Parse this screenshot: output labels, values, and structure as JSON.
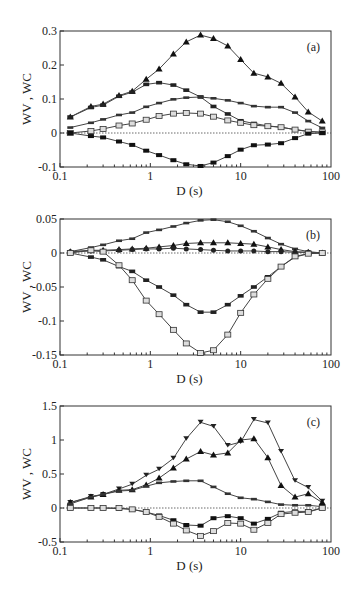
{
  "figure": {
    "panels": [
      "a",
      "b",
      "c"
    ]
  },
  "chart_data": [
    {
      "type": "line",
      "panel_label": "(a)",
      "xlabel": "D (s)",
      "ylabel": "WV , WC",
      "xscale": "log",
      "xlim": [
        0.1,
        100
      ],
      "ylim": [
        -0.1,
        0.3
      ],
      "xticks": [
        "0.1",
        "1",
        "10",
        "100"
      ],
      "yticks": [
        "-0.1",
        "0",
        "0.1",
        "0.2",
        "0.3"
      ],
      "grid": false,
      "zero_line": "dotted",
      "x": [
        0.13,
        0.22,
        0.3,
        0.45,
        0.63,
        0.9,
        1.25,
        1.8,
        2.5,
        3.6,
        5,
        7.2,
        10,
        14,
        20,
        28,
        40,
        56,
        80
      ],
      "series": [
        {
          "name": "filled-triangle",
          "marker": "triangle-filled",
          "values": [
            0.047,
            0.078,
            0.085,
            0.11,
            0.123,
            0.158,
            0.188,
            0.232,
            0.268,
            0.288,
            0.278,
            0.256,
            0.216,
            0.176,
            0.165,
            0.146,
            0.106,
            0.062,
            0.035
          ]
        },
        {
          "name": "filled-dash",
          "marker": "dash-filled",
          "values": [
            0.047,
            0.075,
            0.082,
            0.108,
            0.12,
            0.143,
            0.148,
            0.141,
            0.126,
            0.106,
            0.078,
            0.056,
            0.036,
            0.028,
            0.021,
            0.017,
            0.01,
            0.005,
            0.002
          ]
        },
        {
          "name": "half-dash",
          "marker": "bar",
          "values": [
            0.016,
            0.03,
            0.04,
            0.053,
            0.06,
            0.077,
            0.088,
            0.099,
            0.104,
            0.106,
            0.102,
            0.096,
            0.088,
            0.079,
            0.076,
            0.076,
            0.06,
            0.035,
            0.015
          ]
        },
        {
          "name": "open-square",
          "marker": "square-open",
          "values": [
            0.0,
            0.006,
            0.012,
            0.022,
            0.028,
            0.039,
            0.05,
            0.057,
            0.059,
            0.057,
            0.048,
            0.037,
            0.03,
            0.023,
            0.02,
            0.017,
            0.01,
            0.004,
            0.002
          ]
        },
        {
          "name": "filled-square",
          "marker": "square-filled",
          "values": [
            0.0,
            -0.009,
            -0.013,
            -0.025,
            -0.035,
            -0.052,
            -0.065,
            -0.08,
            -0.092,
            -0.097,
            -0.087,
            -0.068,
            -0.049,
            -0.036,
            -0.034,
            -0.03,
            -0.015,
            -0.002,
            0.0
          ]
        }
      ]
    },
    {
      "type": "line",
      "panel_label": "(b)",
      "xlabel": "D (s)",
      "ylabel": "WV , WC",
      "xscale": "log",
      "xlim": [
        0.1,
        100
      ],
      "ylim": [
        -0.15,
        0.05
      ],
      "xticks": [
        "0.1",
        "1",
        "10",
        "100"
      ],
      "yticks": [
        "-0.15",
        "-0.1",
        "-0.05",
        "0",
        "0.05"
      ],
      "grid": false,
      "zero_line": "dotted",
      "x": [
        0.13,
        0.22,
        0.3,
        0.45,
        0.63,
        0.9,
        1.25,
        1.8,
        2.5,
        3.6,
        5,
        7.2,
        10,
        14,
        20,
        28,
        40,
        56,
        80
      ],
      "series": [
        {
          "name": "half-dash",
          "marker": "bar",
          "values": [
            0.002,
            0.008,
            0.012,
            0.018,
            0.021,
            0.03,
            0.034,
            0.039,
            0.044,
            0.048,
            0.049,
            0.046,
            0.04,
            0.032,
            0.022,
            0.013,
            0.006,
            0.002,
            0.0
          ]
        },
        {
          "name": "filled-triangle",
          "marker": "triangle-filled",
          "values": [
            0.002,
            0.004,
            0.004,
            0.005,
            0.006,
            0.007,
            0.009,
            0.011,
            0.014,
            0.015,
            0.015,
            0.015,
            0.014,
            0.013,
            0.009,
            0.005,
            0.002,
            0.001,
            0.0
          ]
        },
        {
          "name": "filled-circle",
          "marker": "circle-filled",
          "values": [
            0.002,
            0.003,
            0.003,
            0.004,
            0.005,
            0.006,
            0.006,
            0.007,
            0.006,
            0.005,
            0.004,
            0.003,
            0.003,
            0.003,
            0.002,
            0.002,
            0.001,
            0.001,
            0.0
          ]
        },
        {
          "name": "filled-dash",
          "marker": "dash-filled",
          "values": [
            0.0,
            -0.006,
            -0.01,
            -0.02,
            -0.027,
            -0.04,
            -0.05,
            -0.062,
            -0.076,
            -0.087,
            -0.087,
            -0.076,
            -0.063,
            -0.05,
            -0.035,
            -0.02,
            -0.006,
            -0.001,
            0.0
          ]
        },
        {
          "name": "open-square",
          "marker": "square-open",
          "values": [
            0.0,
            0.004,
            0.002,
            -0.018,
            -0.04,
            -0.07,
            -0.09,
            -0.113,
            -0.133,
            -0.147,
            -0.143,
            -0.12,
            -0.088,
            -0.061,
            -0.038,
            -0.02,
            -0.005,
            -0.001,
            0.0
          ]
        }
      ]
    },
    {
      "type": "line",
      "panel_label": "(c)",
      "xlabel": "D (s)",
      "ylabel": "WV , WC",
      "xscale": "log",
      "xlim": [
        0.1,
        100
      ],
      "ylim": [
        -0.5,
        1.5
      ],
      "xticks": [
        "0.1",
        "1",
        "10",
        "100"
      ],
      "yticks": [
        "-0.5",
        "0",
        "0.5",
        "1",
        "1.5"
      ],
      "grid": false,
      "zero_line": "dotted",
      "x": [
        0.13,
        0.22,
        0.3,
        0.45,
        0.63,
        0.9,
        1.25,
        1.8,
        2.5,
        3.6,
        5,
        7.2,
        10,
        14,
        20,
        28,
        40,
        56,
        80
      ],
      "series": [
        {
          "name": "down-triangle",
          "marker": "triangle-down-filled",
          "values": [
            0.08,
            0.17,
            0.2,
            0.28,
            0.35,
            0.48,
            0.57,
            0.73,
            1.02,
            1.26,
            1.2,
            0.92,
            0.97,
            1.3,
            1.25,
            0.83,
            0.4,
            0.3,
            0.1
          ]
        },
        {
          "name": "filled-triangle",
          "marker": "triangle-filled",
          "values": [
            0.08,
            0.16,
            0.2,
            0.26,
            0.27,
            0.34,
            0.44,
            0.59,
            0.72,
            0.83,
            0.78,
            0.81,
            1.0,
            1.02,
            0.74,
            0.33,
            0.16,
            0.21,
            0.08
          ]
        },
        {
          "name": "half-dash",
          "marker": "bar",
          "values": [
            0.06,
            0.16,
            0.2,
            0.25,
            0.26,
            0.32,
            0.37,
            0.39,
            0.4,
            0.4,
            0.31,
            0.21,
            0.15,
            0.13,
            0.09,
            0.05,
            0.04,
            0.04,
            0.02
          ]
        },
        {
          "name": "filled-square",
          "marker": "square-filled",
          "values": [
            0.0,
            0.0,
            0.0,
            -0.01,
            -0.02,
            -0.06,
            -0.11,
            -0.18,
            -0.25,
            -0.26,
            -0.15,
            -0.12,
            -0.15,
            -0.23,
            -0.16,
            -0.07,
            -0.05,
            -0.05,
            0.0
          ]
        },
        {
          "name": "open-square",
          "marker": "square-open",
          "values": [
            0.0,
            0.0,
            0.0,
            0.0,
            -0.02,
            -0.06,
            -0.13,
            -0.23,
            -0.33,
            -0.41,
            -0.34,
            -0.22,
            -0.23,
            -0.32,
            -0.22,
            -0.09,
            -0.07,
            -0.06,
            0.0
          ]
        }
      ]
    }
  ]
}
